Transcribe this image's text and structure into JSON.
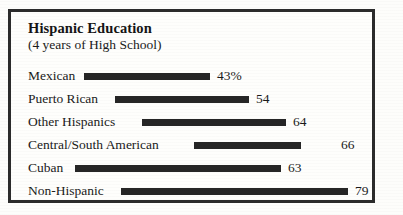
{
  "figure": {
    "title": "Hispanic Education",
    "subtitle": "(4 years of High School)",
    "border_color": "#2b2b2b",
    "bar_color": "#262626",
    "background_color": "#fefefc",
    "text_color": "#1a1a1a"
  },
  "chart_data": {
    "type": "bar",
    "orientation": "horizontal",
    "title": "Hispanic Education",
    "subtitle": "(4 years of High School)",
    "xlabel": "",
    "ylabel": "",
    "unit": "percent",
    "grid": false,
    "legend": null,
    "categories": [
      "Mexican",
      "Puerto Rican",
      "Other Hispanics",
      "Central/South American",
      "Cuban",
      "Non-Hispanic"
    ],
    "values": [
      43,
      54,
      64,
      66,
      63,
      79
    ],
    "value_labels": [
      "43%",
      "54",
      "64",
      "66",
      "63",
      "79"
    ],
    "ylim": [
      0,
      100
    ],
    "note": "Bars begin immediately after each category label rather than from a shared baseline; bar lengths are not proportional to values."
  },
  "rows": [
    {
      "label": "Mexican",
      "value": 43,
      "value_label": "43%",
      "bar_start": 73,
      "bar_end": 199,
      "value_x": 206,
      "row_top": 55
    },
    {
      "label": "Puerto Rican",
      "value": 54,
      "value_label": "54",
      "bar_start": 104,
      "bar_end": 238,
      "value_x": 245,
      "row_top": 78
    },
    {
      "label": "Other Hispanics",
      "value": 64,
      "value_label": "64",
      "bar_start": 131,
      "bar_end": 275,
      "value_x": 282,
      "row_top": 101
    },
    {
      "label": "Central/South American",
      "value": 66,
      "value_label": "66",
      "bar_start": 183,
      "bar_end": 290,
      "value_x": 330,
      "row_top": 124
    },
    {
      "label": "Cuban",
      "value": 63,
      "value_label": "63",
      "bar_start": 64,
      "bar_end": 270,
      "value_x": 277,
      "row_top": 147
    },
    {
      "label": "Non-Hispanic",
      "value": 79,
      "value_label": "79",
      "bar_start": 110,
      "bar_end": 337,
      "value_x": 344,
      "row_top": 170
    }
  ]
}
